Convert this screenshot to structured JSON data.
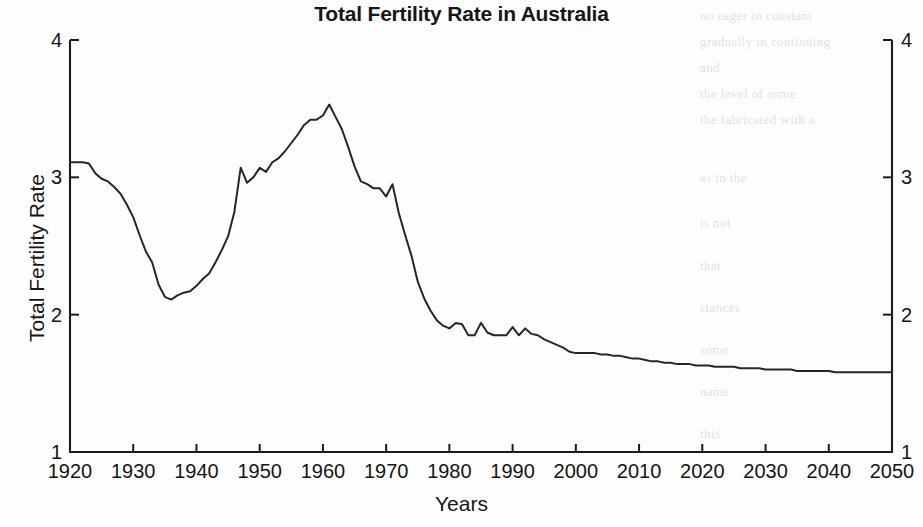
{
  "chart_data": {
    "type": "line",
    "title": "Total Fertility Rate in Australia",
    "xlabel": "Years",
    "ylabel": "Total Fertility Rate",
    "xlim": [
      1920,
      2050
    ],
    "ylim": [
      1,
      4
    ],
    "grid": false,
    "legend": null,
    "xticks": [
      "1920",
      "1930",
      "1940",
      "1950",
      "1960",
      "1970",
      "1980",
      "1990",
      "2000",
      "2010",
      "2020",
      "2030",
      "2040",
      "2050"
    ],
    "xtick_values": [
      1920,
      1930,
      1940,
      1950,
      1960,
      1970,
      1980,
      1990,
      2000,
      2010,
      2020,
      2030,
      2040,
      2050
    ],
    "yticks": [
      "1",
      "2",
      "3",
      "4"
    ],
    "ytick_values": [
      1,
      2,
      3,
      4
    ],
    "ytick_labels_right": [
      "1",
      "2",
      "3",
      "4"
    ],
    "line_color": "#262626",
    "series": [
      {
        "name": "Total Fertility Rate",
        "x": [
          1920,
          1921,
          1922,
          1923,
          1924,
          1925,
          1926,
          1927,
          1928,
          1929,
          1930,
          1931,
          1932,
          1933,
          1934,
          1935,
          1936,
          1937,
          1938,
          1939,
          1940,
          1941,
          1942,
          1943,
          1944,
          1945,
          1946,
          1947,
          1948,
          1949,
          1950,
          1951,
          1952,
          1953,
          1954,
          1955,
          1956,
          1957,
          1958,
          1959,
          1960,
          1961,
          1962,
          1963,
          1964,
          1965,
          1966,
          1967,
          1968,
          1969,
          1970,
          1971,
          1972,
          1973,
          1974,
          1975,
          1976,
          1977,
          1978,
          1979,
          1980,
          1981,
          1982,
          1983,
          1984,
          1985,
          1986,
          1987,
          1988,
          1989,
          1990,
          1991,
          1992,
          1993,
          1994,
          1995,
          1996,
          1997,
          1998,
          1999,
          2000,
          2001,
          2002,
          2003,
          2004,
          2005,
          2006,
          2007,
          2008,
          2009,
          2010,
          2011,
          2012,
          2013,
          2014,
          2015,
          2016,
          2017,
          2018,
          2019,
          2020,
          2021,
          2022,
          2023,
          2024,
          2025,
          2026,
          2027,
          2028,
          2029,
          2030,
          2031,
          2032,
          2033,
          2034,
          2035,
          2036,
          2037,
          2038,
          2039,
          2040,
          2041,
          2042,
          2043,
          2044,
          2045,
          2046,
          2047,
          2048,
          2049,
          2050
        ],
        "y": [
          3.11,
          3.11,
          3.11,
          3.1,
          3.03,
          2.99,
          2.97,
          2.93,
          2.88,
          2.8,
          2.71,
          2.58,
          2.46,
          2.38,
          2.22,
          2.13,
          2.11,
          2.14,
          2.16,
          2.17,
          2.21,
          2.26,
          2.3,
          2.38,
          2.47,
          2.57,
          2.75,
          3.07,
          2.96,
          3.0,
          3.07,
          3.04,
          3.11,
          3.14,
          3.19,
          3.25,
          3.31,
          3.38,
          3.42,
          3.42,
          3.45,
          3.53,
          3.44,
          3.35,
          3.22,
          3.08,
          2.97,
          2.95,
          2.92,
          2.92,
          2.86,
          2.95,
          2.74,
          2.58,
          2.43,
          2.24,
          2.12,
          2.03,
          1.96,
          1.92,
          1.9,
          1.94,
          1.93,
          1.85,
          1.85,
          1.94,
          1.87,
          1.85,
          1.85,
          1.85,
          1.91,
          1.85,
          1.9,
          1.86,
          1.85,
          1.82,
          1.8,
          1.78,
          1.76,
          1.73,
          1.72,
          1.72,
          1.72,
          1.72,
          1.71,
          1.71,
          1.7,
          1.7,
          1.69,
          1.68,
          1.68,
          1.67,
          1.66,
          1.66,
          1.65,
          1.65,
          1.64,
          1.64,
          1.64,
          1.63,
          1.63,
          1.63,
          1.62,
          1.62,
          1.62,
          1.62,
          1.61,
          1.61,
          1.61,
          1.61,
          1.6,
          1.6,
          1.6,
          1.6,
          1.6,
          1.59,
          1.59,
          1.59,
          1.59,
          1.59,
          1.59,
          1.58,
          1.58,
          1.58,
          1.58,
          1.58,
          1.58,
          1.58,
          1.58,
          1.58,
          1.58
        ]
      }
    ],
    "annotations": []
  },
  "figure": {
    "background_color": "#fefefe",
    "axis_color": "#1b1b1b"
  },
  "bleed_text": {
    "lines": [
      "no eager in constant",
      "gradually in continuing",
      "and",
      "the level of some",
      "the fabricated with a",
      "as in the",
      "is not",
      "that",
      "stances",
      "some",
      "name",
      "this"
    ]
  }
}
